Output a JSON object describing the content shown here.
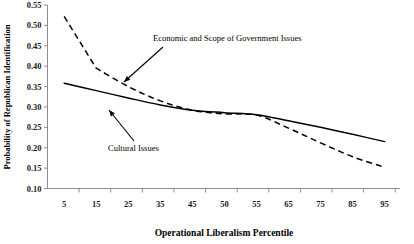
{
  "chart_data": {
    "type": "line",
    "title": "",
    "xlabel": "Operational Liberalism Percentile",
    "ylabel": "Probability of Republican Identification",
    "categories": [
      "5",
      "15",
      "25",
      "35",
      "45",
      "50",
      "55",
      "65",
      "75",
      "85",
      "95"
    ],
    "xticklabels": [
      "5",
      "15",
      "25",
      "35",
      "45",
      "50",
      "55",
      "65",
      "75",
      "85",
      "95"
    ],
    "yticklabels": [
      "0.10",
      "0.15",
      "0.20",
      "0.25",
      "0.30",
      "0.35",
      "0.40",
      "0.45",
      "0.50",
      "0.55"
    ],
    "ylim": [
      0.1,
      0.55
    ],
    "ytick_step": 0.05,
    "grid": false,
    "legend": "annotations",
    "series": [
      {
        "name": "Economic and Scope of Government Issues",
        "style": "dashed",
        "color": "#000000",
        "values": [
          0.522,
          0.395,
          0.35,
          0.315,
          0.292,
          0.283,
          0.28,
          0.248,
          0.212,
          0.178,
          0.152
        ]
      },
      {
        "name": "Cultural Issues",
        "style": "solid",
        "color": "#000000",
        "values": [
          0.358,
          0.34,
          0.322,
          0.305,
          0.292,
          0.286,
          0.281,
          0.266,
          0.25,
          0.233,
          0.215
        ]
      }
    ],
    "annotations": [
      {
        "name": "economic-scope-label",
        "text": "Economic and Scope of Government Issues",
        "text_x": 153,
        "text_y": 41,
        "arrow_from_x": 163,
        "arrow_from_y": 47,
        "arrow_to_x": 124,
        "arrow_to_y": 82
      },
      {
        "name": "cultural-issues-label",
        "text": "Cultural Issues",
        "text_x": 108,
        "text_y": 151,
        "arrow_from_x": 134,
        "arrow_from_y": 141,
        "arrow_to_x": 109,
        "arrow_to_y": 110
      }
    ],
    "colors": {
      "axis": "#8c8c8c",
      "series": "#000000",
      "background": "#ffffff"
    }
  }
}
